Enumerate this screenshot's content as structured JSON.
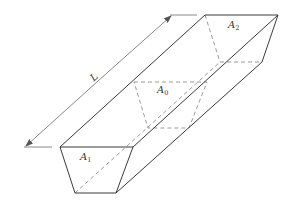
{
  "diagram": {
    "colors": {
      "line": "#3a3a3a",
      "dashed": "#808080",
      "dimension": "#6a6a6a",
      "text": "#333333"
    },
    "labels": {
      "length": "L",
      "front_area": {
        "base": "A",
        "sub": "1"
      },
      "mid_area": {
        "base": "A",
        "sub": "0"
      },
      "back_area": {
        "base": "A",
        "sub": "2"
      }
    },
    "geometry": {
      "front_face": [
        [
          60,
          147
        ],
        [
          133,
          147
        ],
        [
          116,
          193
        ],
        [
          75,
          193
        ]
      ],
      "back_face": [
        [
          205,
          15
        ],
        [
          278,
          15
        ],
        [
          262,
          62
        ],
        [
          220,
          62
        ]
      ],
      "mid_section": [
        [
          134,
          82
        ],
        [
          207,
          82
        ],
        [
          189,
          128
        ],
        [
          148,
          128
        ]
      ],
      "dimension_line": {
        "start": [
          25,
          147
        ],
        "end": [
          172,
          15
        ]
      },
      "extension_lines": [
        [
          [
            28,
            147
          ],
          [
            52,
            147
          ]
        ],
        [
          [
            175,
            15
          ],
          [
            197,
            15
          ]
        ]
      ]
    }
  }
}
